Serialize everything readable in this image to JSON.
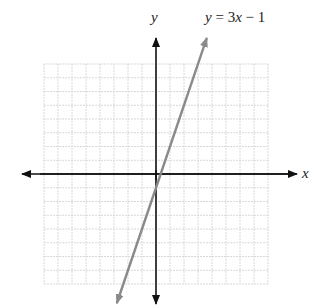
{
  "chart_data": {
    "type": "line",
    "title": "",
    "equation_label": "y = 3x − 1",
    "xlabel": "x",
    "ylabel": "y",
    "xlim": [
      -8,
      8
    ],
    "ylim": [
      -8,
      8
    ],
    "grid": true,
    "tick_labels": false,
    "series": [
      {
        "name": "y = 3x − 1",
        "slope": 3,
        "intercept": -1,
        "x": [
          -2.8,
          -2,
          -1,
          0,
          0.3333,
          1,
          2,
          3,
          3.63
        ],
        "y": [
          -9.4,
          -7,
          -4,
          -1,
          0,
          2,
          5,
          8,
          9.9
        ],
        "color": "#8a8a8a"
      }
    ],
    "axis_color": "#111111",
    "grid_color": "#d8d8d8"
  },
  "labels": {
    "x_axis": "x",
    "y_axis": "y",
    "equation_prefix": "y",
    "equation_rest": " = 3",
    "equation_x": "x",
    "equation_tail": " − 1"
  }
}
